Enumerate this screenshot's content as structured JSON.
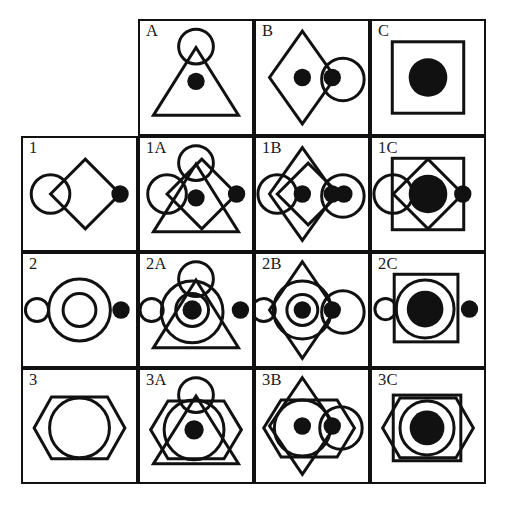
{
  "figure": {
    "kind": "shape-combination-matrix",
    "rows": 4,
    "columns": 4,
    "stroke_color": "#111111",
    "fill_color": "#111111",
    "background_color": "#ffffff"
  },
  "labels": {
    "corner": "",
    "col_headers": [
      "A",
      "B",
      "C"
    ],
    "row_headers": [
      "1",
      "2",
      "3"
    ],
    "cells": [
      [
        "",
        "A",
        "B",
        "C"
      ],
      [
        "1",
        "1A",
        "1B",
        "1C"
      ],
      [
        "2",
        "2A",
        "2B",
        "2C"
      ],
      [
        "3",
        "3A",
        "3B",
        "3C"
      ]
    ]
  },
  "shape_parts": {
    "A": "triangle-with-top-circle-and-center-dot",
    "B": "vertical-diamond-with-center-dot-and-right-circle-with-dot",
    "C": "square-with-large-filled-circle",
    "1": "horizontal-diamond-with-left-circle-and-right-filled-dot",
    "2": "concentric-circles-with-small-left-circle-and-right-filled-dot",
    "3": "hexagon-with-inner-circle"
  },
  "cell_contents": {
    "A": [
      "triangle",
      "top-circle",
      "center-dot"
    ],
    "B": [
      "vertical-diamond",
      "center-dot",
      "right-circle",
      "right-dot"
    ],
    "C": [
      "square",
      "large-filled-circle"
    ],
    "1": [
      "horizontal-diamond",
      "left-circle",
      "right-filled-dot"
    ],
    "1A": [
      "horizontal-diamond",
      "left-circle",
      "right-filled-dot",
      "triangle",
      "top-circle",
      "center-dot"
    ],
    "1B": [
      "horizontal-diamond",
      "left-circle",
      "right-filled-dot",
      "vertical-diamond",
      "center-dot",
      "right-circle",
      "right-dot"
    ],
    "1C": [
      "horizontal-diamond",
      "left-circle",
      "right-filled-dot",
      "square",
      "large-filled-circle"
    ],
    "2": [
      "outer-circle",
      "inner-circle",
      "small-left-circle",
      "right-filled-dot"
    ],
    "2A": [
      "outer-circle",
      "inner-circle",
      "small-left-circle",
      "right-filled-dot",
      "triangle",
      "top-circle",
      "center-dot"
    ],
    "2B": [
      "outer-circle",
      "inner-circle",
      "small-left-circle",
      "right-filled-dot",
      "vertical-diamond",
      "center-dot",
      "right-circle",
      "right-dot"
    ],
    "2C": [
      "outer-circle",
      "inner-circle",
      "small-left-circle",
      "right-filled-dot",
      "square",
      "large-filled-circle"
    ],
    "3": [
      "hexagon",
      "inner-circle"
    ],
    "3A": [
      "hexagon",
      "inner-circle",
      "triangle",
      "top-circle",
      "center-dot"
    ],
    "3B": [
      "hexagon",
      "inner-circle",
      "vertical-diamond",
      "center-dot",
      "right-circle",
      "right-dot"
    ],
    "3C": [
      "hexagon",
      "inner-circle",
      "square",
      "large-filled-circle"
    ]
  }
}
